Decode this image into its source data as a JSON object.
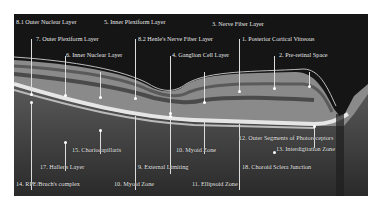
{
  "figure": {
    "labels": [
      {
        "id": "1",
        "text": "1. Posterior Cortical Vitreous"
      },
      {
        "id": "2",
        "text": "2. Pre-retinal Space"
      },
      {
        "id": "3",
        "text": "3. Nerve Fiber Layer"
      },
      {
        "id": "4",
        "text": "4. Ganglion Cell Layer"
      },
      {
        "id": "5",
        "text": "5. Inner Plexiform Layer"
      },
      {
        "id": "6",
        "text": "6. Inner Nuclear Layer"
      },
      {
        "id": "7",
        "text": "7. Outer Plexiform Layer"
      },
      {
        "id": "8.1",
        "text": "8.1 Outer Nuclear Layer"
      },
      {
        "id": "8.2",
        "text": "8.2 Henle's Nerve Fiber Layer"
      },
      {
        "id": "9",
        "text": "9. External Limiting"
      },
      {
        "id": "10",
        "text": "10. Myoid Zone"
      },
      {
        "id": "11",
        "text": "11. Ellipsoid Zone"
      },
      {
        "id": "12",
        "text": "12. Outer Segments of Photoreceptors"
      },
      {
        "id": "13",
        "text": "13. Interdigitation Zone"
      },
      {
        "id": "14",
        "text": "14. RPE/Bruch's complex"
      },
      {
        "id": "15",
        "text": "15. Choriocapillaris"
      },
      {
        "id": "16",
        "text": "16. Sattler's Layer"
      },
      {
        "id": "17",
        "text": "17. Haller's Layer"
      },
      {
        "id": "18",
        "text": "18. Choroid Sclera Junction"
      }
    ]
  }
}
